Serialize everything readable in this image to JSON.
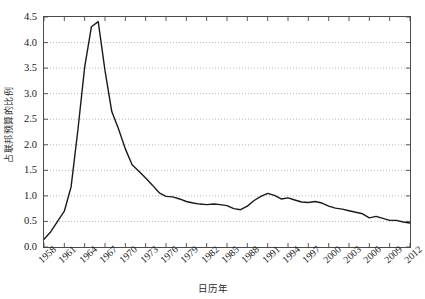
{
  "chart_data": {
    "type": "line",
    "title": "",
    "xlabel": "日历年",
    "ylabel": "占联邦预算的比例",
    "xlim": [
      1958,
      2012
    ],
    "ylim": [
      0.0,
      4.5
    ],
    "grid": "horizontal-dotted",
    "legend": "none",
    "line_color": "#1a1a1a",
    "x_tick_labels": [
      "1958",
      "1961",
      "1964",
      "1967",
      "1970",
      "1973",
      "1976",
      "1979",
      "1982",
      "1985",
      "1988",
      "1991",
      "1994",
      "1997",
      "2000",
      "2003",
      "2006",
      "2009",
      "2012"
    ],
    "y_tick_labels": [
      "0.0",
      "0.5",
      "1.0",
      "1.5",
      "2.0",
      "2.5",
      "3.0",
      "3.5",
      "4.0",
      "4.5"
    ],
    "y_tick_values": [
      0.0,
      0.5,
      1.0,
      1.5,
      2.0,
      2.5,
      3.0,
      3.5,
      4.0,
      4.5
    ],
    "x": [
      1958,
      1959,
      1960,
      1961,
      1962,
      1963,
      1964,
      1965,
      1966,
      1967,
      1968,
      1969,
      1970,
      1971,
      1972,
      1973,
      1974,
      1975,
      1976,
      1977,
      1978,
      1979,
      1980,
      1981,
      1982,
      1983,
      1984,
      1985,
      1986,
      1987,
      1988,
      1989,
      1990,
      1991,
      1992,
      1993,
      1994,
      1995,
      1996,
      1997,
      1998,
      1999,
      2000,
      2001,
      2002,
      2003,
      2004,
      2005,
      2006,
      2007,
      2008,
      2009,
      2010,
      2011,
      2012
    ],
    "values": [
      0.15,
      0.3,
      0.5,
      0.7,
      1.18,
      2.29,
      3.52,
      4.31,
      4.41,
      3.45,
      2.65,
      2.31,
      1.92,
      1.61,
      1.48,
      1.35,
      1.21,
      1.06,
      0.99,
      0.98,
      0.94,
      0.89,
      0.86,
      0.84,
      0.83,
      0.84,
      0.83,
      0.81,
      0.75,
      0.73,
      0.8,
      0.91,
      0.99,
      1.05,
      1.01,
      0.94,
      0.96,
      0.92,
      0.88,
      0.87,
      0.89,
      0.86,
      0.8,
      0.76,
      0.74,
      0.71,
      0.68,
      0.65,
      0.57,
      0.6,
      0.56,
      0.52,
      0.52,
      0.49,
      0.47
    ]
  },
  "axes": {
    "y_label_text": "占联邦预算的比例",
    "x_label_text": "日历年"
  }
}
